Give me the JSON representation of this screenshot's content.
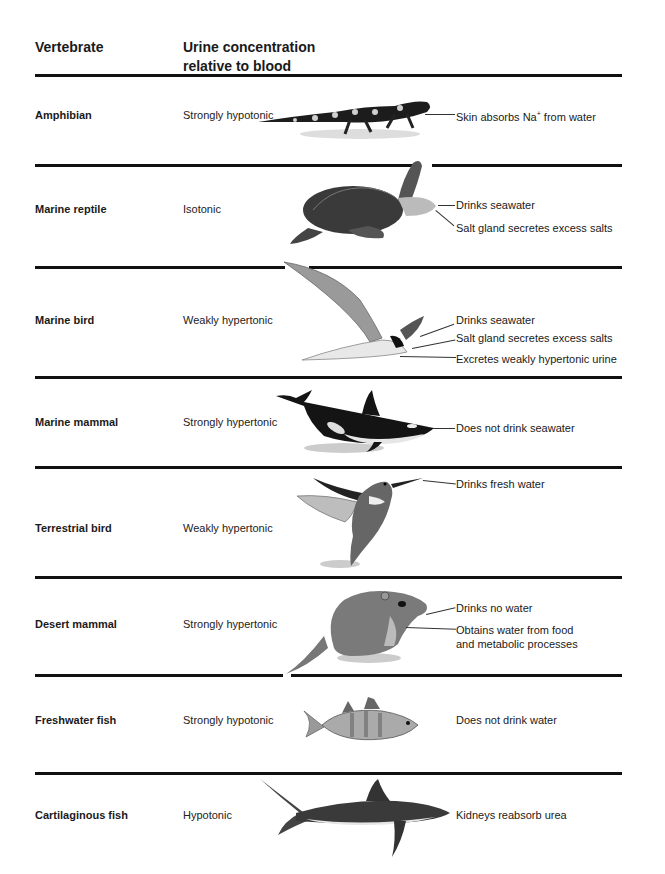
{
  "header": {
    "col1": "Vertebrate",
    "col2_line1": "Urine concentration",
    "col2_line2": "relative to blood"
  },
  "rows": [
    {
      "vertebrate": "Amphibian",
      "concentration": "Strongly hypotonic",
      "icon": "salamander-icon",
      "notes": [
        {
          "pre": "Skin absorbs Na",
          "sup": "+",
          "post": " from water"
        }
      ]
    },
    {
      "vertebrate": "Marine reptile",
      "concentration": "Isotonic",
      "icon": "sea-turtle-icon",
      "notes": [
        {
          "text": "Drinks seawater"
        },
        {
          "text": "Salt gland secretes excess salts"
        }
      ]
    },
    {
      "vertebrate": "Marine bird",
      "concentration": "Weakly hypertonic",
      "icon": "tern-icon",
      "notes": [
        {
          "text": "Drinks seawater"
        },
        {
          "text": "Salt gland secretes excess salts"
        },
        {
          "text": "Excretes weakly hypertonic urine"
        }
      ]
    },
    {
      "vertebrate": "Marine mammal",
      "concentration": "Strongly hypertonic",
      "icon": "orca-icon",
      "notes": [
        {
          "text": "Does not drink seawater"
        }
      ]
    },
    {
      "vertebrate": "Terrestrial bird",
      "concentration": "Weakly hypertonic",
      "icon": "hummingbird-icon",
      "notes": [
        {
          "text": "Drinks fresh water"
        }
      ]
    },
    {
      "vertebrate": "Desert mammal",
      "concentration": "Strongly hypertonic",
      "icon": "kangaroo-rat-icon",
      "notes": [
        {
          "text": "Drinks no water"
        },
        {
          "text": "Obtains water from food"
        },
        {
          "text": "and metabolic processes"
        }
      ]
    },
    {
      "vertebrate": "Freshwater fish",
      "concentration": "Strongly hypotonic",
      "icon": "perch-icon",
      "notes": [
        {
          "text": "Does not drink water"
        }
      ]
    },
    {
      "vertebrate": "Cartilaginous fish",
      "concentration": "Hypotonic",
      "icon": "shark-icon",
      "notes": [
        {
          "text": "Kidneys reabsorb urea"
        }
      ]
    }
  ],
  "colors": {
    "rule": "#111111",
    "text": "#1a1a1a",
    "background": "#ffffff"
  }
}
